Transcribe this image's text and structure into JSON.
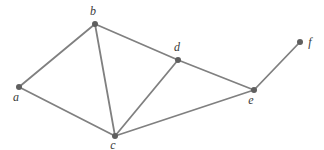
{
  "figure": {
    "type": "undirected-graph-diagram",
    "background_color": "#ffffff",
    "edge_color": "#808080",
    "edge_width": 1.8,
    "node_color": "#5f5f5f",
    "node_radius": 3,
    "label_color": "#3a3a3a",
    "label_font_size": 12
  },
  "graph": {
    "nodes": [
      {
        "id": "a",
        "label": "a",
        "x": 19,
        "y": 87,
        "lx": 16,
        "ly": 101
      },
      {
        "id": "b",
        "label": "b",
        "x": 95,
        "y": 24,
        "lx": 93,
        "ly": 15
      },
      {
        "id": "c",
        "label": "c",
        "x": 115,
        "y": 136,
        "lx": 113,
        "ly": 149
      },
      {
        "id": "d",
        "label": "d",
        "x": 178,
        "y": 60,
        "lx": 177,
        "ly": 51
      },
      {
        "id": "e",
        "label": "e",
        "x": 254,
        "y": 90,
        "lx": 251,
        "ly": 104
      },
      {
        "id": "f",
        "label": "f",
        "x": 300,
        "y": 42,
        "lx": 310,
        "ly": 46
      }
    ],
    "edges": [
      [
        "a",
        "b"
      ],
      [
        "a",
        "c"
      ],
      [
        "b",
        "c"
      ],
      [
        "b",
        "d"
      ],
      [
        "c",
        "d"
      ],
      [
        "c",
        "e"
      ],
      [
        "d",
        "e"
      ],
      [
        "e",
        "f"
      ]
    ]
  }
}
